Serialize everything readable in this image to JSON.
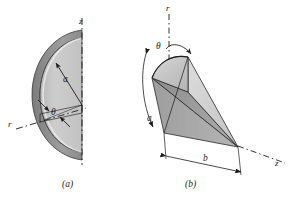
{
  "figure": {
    "type": "technical-line-drawing",
    "background_color": "#ffffff",
    "ink_color": "#1c1c1c",
    "panels": [
      {
        "id": "a",
        "caption": "(a)",
        "description": "Half-disk / hemispherical shell segment sectioned on the z axis",
        "labels": [
          {
            "name": "z-axis-label",
            "text": "z"
          },
          {
            "name": "r-axis-label",
            "text": "r"
          },
          {
            "name": "radius-label",
            "text": "a"
          },
          {
            "name": "angle-label",
            "text": "θ"
          }
        ],
        "shading": {
          "front_face": "#c9c9c9",
          "rim_face": "#8e8e8e",
          "edge_face": "#b3b3b3"
        }
      },
      {
        "id": "b",
        "caption": "(b)",
        "description": "Oblique cone with apex on the z axis, slant height a and base length b",
        "labels": [
          {
            "name": "r-axis-label",
            "text": "r"
          },
          {
            "name": "z-axis-label",
            "text": "z"
          },
          {
            "name": "slant-label",
            "text": "a"
          },
          {
            "name": "base-label",
            "text": "b"
          },
          {
            "name": "angle-label",
            "text": "θ"
          }
        ],
        "shading": {
          "top_face": "#c4c4c4",
          "left_face": "#9a9a9a",
          "right_face": "#d2d2d2",
          "bottom_face": "#a8a8a8"
        }
      }
    ]
  },
  "labels": {
    "panel_a": {
      "z": "z",
      "r": "r",
      "a": "a",
      "theta": "θ",
      "caption": "(a)"
    },
    "panel_b": {
      "r": "r",
      "z": "z",
      "a": "a",
      "b": "b",
      "theta": "θ",
      "caption": "(b)"
    }
  }
}
